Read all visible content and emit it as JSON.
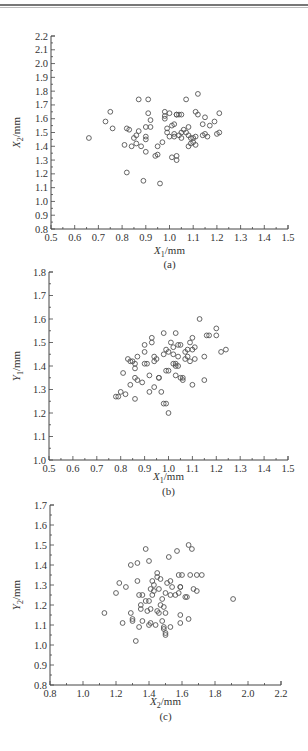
{
  "header": {
    "rule": true
  },
  "chart_data": [
    {
      "type": "scatter",
      "panel": "(a)",
      "title": "",
      "xlabel": "X1/mm",
      "ylabel": "X2/mm",
      "xlim": [
        0.5,
        1.5
      ],
      "ylim": [
        0.8,
        2.2
      ],
      "xticks": [
        0.5,
        0.6,
        0.7,
        0.8,
        0.9,
        1.0,
        1.1,
        1.2,
        1.3,
        1.4,
        1.5
      ],
      "yticks": [
        0.8,
        0.9,
        1.0,
        1.1,
        1.2,
        1.3,
        1.4,
        1.5,
        1.6,
        1.7,
        1.8,
        1.9,
        2.0,
        2.1,
        2.2
      ],
      "grid": false,
      "marker": "open-circle",
      "x": [
        0.66,
        0.73,
        0.75,
        0.76,
        0.81,
        0.82,
        0.82,
        0.83,
        0.84,
        0.85,
        0.86,
        0.86,
        0.87,
        0.87,
        0.88,
        0.89,
        0.9,
        0.9,
        0.9,
        0.9,
        0.91,
        0.91,
        0.92,
        0.92,
        0.94,
        0.95,
        0.95,
        0.96,
        0.97,
        0.98,
        0.98,
        0.98,
        0.99,
        0.99,
        1.0,
        1.0,
        1.01,
        1.01,
        1.02,
        1.02,
        1.02,
        1.03,
        1.03,
        1.03,
        1.03,
        1.04,
        1.04,
        1.05,
        1.05,
        1.05,
        1.06,
        1.07,
        1.07,
        1.08,
        1.08,
        1.08,
        1.09,
        1.09,
        1.1,
        1.1,
        1.11,
        1.11,
        1.11,
        1.12,
        1.12,
        1.14,
        1.14,
        1.15,
        1.15,
        1.16,
        1.17,
        1.19,
        1.2,
        1.21,
        1.21
      ],
      "y": [
        1.46,
        1.58,
        1.65,
        1.53,
        1.41,
        1.53,
        1.21,
        1.52,
        1.4,
        1.46,
        1.48,
        1.42,
        1.51,
        1.74,
        1.4,
        1.15,
        1.54,
        1.47,
        1.45,
        1.36,
        1.64,
        1.74,
        1.54,
        1.59,
        1.33,
        1.34,
        1.4,
        1.13,
        1.43,
        1.6,
        1.62,
        1.65,
        1.53,
        1.5,
        1.47,
        1.64,
        1.55,
        1.32,
        1.56,
        1.49,
        1.47,
        1.63,
        1.63,
        1.33,
        1.3,
        1.48,
        1.63,
        1.5,
        1.46,
        1.63,
        1.52,
        1.5,
        1.74,
        1.54,
        1.4,
        1.48,
        1.46,
        1.42,
        1.43,
        1.46,
        1.65,
        1.41,
        1.47,
        1.78,
        1.63,
        1.56,
        1.48,
        1.61,
        1.49,
        1.47,
        1.55,
        1.58,
        1.49,
        1.64,
        1.5
      ]
    },
    {
      "type": "scatter",
      "panel": "(b)",
      "title": "",
      "xlabel": "X1/mm",
      "ylabel": "Y1/mm",
      "xlim": [
        0.5,
        1.5
      ],
      "ylim": [
        1.0,
        1.8
      ],
      "xticks": [
        0.5,
        0.6,
        0.7,
        0.8,
        0.9,
        1.0,
        1.1,
        1.2,
        1.3,
        1.4,
        1.5
      ],
      "yticks": [
        1.0,
        1.1,
        1.2,
        1.3,
        1.4,
        1.5,
        1.6,
        1.7,
        1.8
      ],
      "grid": false,
      "marker": "open-circle",
      "x": [
        0.78,
        0.79,
        0.8,
        0.81,
        0.82,
        0.83,
        0.84,
        0.84,
        0.85,
        0.86,
        0.86,
        0.86,
        0.86,
        0.87,
        0.87,
        0.89,
        0.9,
        0.9,
        0.9,
        0.91,
        0.92,
        0.92,
        0.93,
        0.93,
        0.94,
        0.94,
        0.94,
        0.95,
        0.96,
        0.96,
        0.97,
        0.98,
        0.98,
        0.98,
        0.99,
        0.99,
        0.99,
        1.0,
        1.0,
        1.0,
        1.01,
        1.02,
        1.02,
        1.02,
        1.03,
        1.03,
        1.03,
        1.03,
        1.04,
        1.04,
        1.04,
        1.05,
        1.05,
        1.06,
        1.06,
        1.07,
        1.07,
        1.08,
        1.08,
        1.09,
        1.09,
        1.1,
        1.1,
        1.1,
        1.11,
        1.11,
        1.13,
        1.15,
        1.15,
        1.16,
        1.17,
        1.2,
        1.2,
        1.22,
        1.24
      ],
      "y": [
        1.27,
        1.27,
        1.29,
        1.37,
        1.28,
        1.43,
        1.32,
        1.42,
        1.42,
        1.41,
        1.39,
        1.35,
        1.26,
        1.34,
        1.44,
        1.33,
        1.49,
        1.46,
        1.41,
        1.41,
        1.36,
        1.29,
        1.5,
        1.52,
        1.42,
        1.31,
        1.44,
        1.43,
        1.35,
        1.35,
        1.29,
        1.24,
        1.45,
        1.54,
        1.38,
        1.47,
        1.24,
        1.46,
        1.38,
        1.2,
        1.5,
        1.41,
        1.45,
        1.48,
        1.54,
        1.41,
        1.4,
        1.36,
        1.49,
        1.44,
        1.4,
        1.35,
        1.49,
        1.35,
        1.34,
        1.43,
        1.46,
        1.44,
        1.47,
        1.5,
        1.42,
        1.52,
        1.32,
        1.47,
        1.48,
        1.43,
        1.6,
        1.34,
        1.44,
        1.53,
        1.53,
        1.56,
        1.53,
        1.46,
        1.47
      ]
    },
    {
      "type": "scatter",
      "panel": "(c)",
      "title": "",
      "xlabel": "X2/mm",
      "ylabel": "Y2/mm",
      "xlim": [
        0.8,
        2.2
      ],
      "ylim": [
        0.8,
        1.7
      ],
      "xticks": [
        0.8,
        1.0,
        1.2,
        1.4,
        1.6,
        1.8,
        2.0,
        2.2
      ],
      "yticks": [
        0.8,
        0.9,
        1.0,
        1.1,
        1.2,
        1.3,
        1.4,
        1.5,
        1.6,
        1.7
      ],
      "grid": false,
      "marker": "open-circle",
      "x": [
        1.13,
        1.2,
        1.22,
        1.24,
        1.26,
        1.29,
        1.29,
        1.3,
        1.3,
        1.32,
        1.33,
        1.33,
        1.34,
        1.34,
        1.35,
        1.35,
        1.36,
        1.36,
        1.38,
        1.38,
        1.39,
        1.4,
        1.4,
        1.4,
        1.41,
        1.41,
        1.41,
        1.42,
        1.42,
        1.43,
        1.43,
        1.44,
        1.45,
        1.45,
        1.45,
        1.46,
        1.46,
        1.47,
        1.47,
        1.48,
        1.48,
        1.49,
        1.49,
        1.49,
        1.5,
        1.5,
        1.5,
        1.5,
        1.51,
        1.52,
        1.53,
        1.53,
        1.53,
        1.54,
        1.56,
        1.57,
        1.58,
        1.58,
        1.59,
        1.59,
        1.59,
        1.59,
        1.6,
        1.62,
        1.63,
        1.64,
        1.64,
        1.65,
        1.66,
        1.67,
        1.69,
        1.69,
        1.72,
        1.91
      ],
      "y": [
        1.16,
        1.26,
        1.31,
        1.11,
        1.29,
        1.4,
        1.16,
        1.13,
        1.12,
        1.02,
        1.32,
        1.41,
        1.25,
        1.09,
        1.18,
        1.2,
        1.12,
        1.25,
        1.48,
        1.22,
        1.17,
        1.42,
        1.22,
        1.1,
        1.28,
        1.11,
        1.18,
        1.32,
        1.25,
        1.3,
        1.27,
        1.1,
        1.36,
        1.34,
        1.17,
        1.28,
        1.16,
        1.33,
        1.2,
        1.12,
        1.23,
        1.09,
        1.19,
        1.08,
        1.26,
        1.06,
        1.16,
        1.05,
        1.31,
        1.44,
        1.32,
        1.25,
        1.09,
        1.29,
        1.25,
        1.47,
        1.26,
        1.35,
        1.29,
        1.15,
        1.11,
        1.29,
        1.35,
        1.24,
        1.24,
        1.5,
        1.13,
        1.35,
        1.48,
        1.28,
        1.27,
        1.35,
        1.35,
        1.23
      ]
    }
  ],
  "panels": [
    {
      "caption": "(a)",
      "xlabel_var": "X",
      "xlabel_sub": "1",
      "xlabel_unit": "/mm",
      "ylabel_var": "X",
      "ylabel_sub": "2",
      "ylabel_unit": "/mm"
    },
    {
      "caption": "(b)",
      "xlabel_var": "X",
      "xlabel_sub": "1",
      "xlabel_unit": "/mm",
      "ylabel_var": "Y",
      "ylabel_sub": "1",
      "ylabel_unit": "/mm"
    },
    {
      "caption": "(c)",
      "xlabel_var": "X",
      "xlabel_sub": "2",
      "xlabel_unit": "/mm",
      "ylabel_var": "Y",
      "ylabel_sub": "2",
      "ylabel_unit": "/mm"
    }
  ],
  "layout": [
    {
      "left": 51,
      "right": 288,
      "top": 36,
      "bottom": 229,
      "xlabelY": 256,
      "captionY": 268
    },
    {
      "left": 49,
      "right": 288,
      "top": 272,
      "bottom": 460,
      "xlabelY": 482,
      "captionY": 495
    },
    {
      "left": 50,
      "right": 281,
      "top": 505,
      "bottom": 685,
      "xlabelY": 707,
      "captionY": 720
    }
  ]
}
